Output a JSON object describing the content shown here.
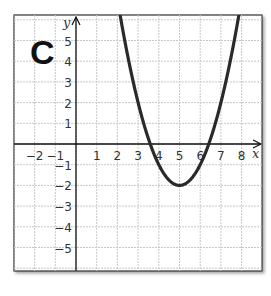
{
  "chart_data": {
    "type": "line",
    "title": "",
    "panel_label": "C",
    "xlabel": "x",
    "ylabel": "y",
    "xlim": [
      -3,
      9
    ],
    "ylim": [
      -6.2,
      6.2
    ],
    "grid": true,
    "x_ticks": [
      -2,
      -1,
      1,
      2,
      3,
      4,
      5,
      6,
      7,
      8
    ],
    "y_ticks": [
      5,
      4,
      3,
      2,
      1,
      -1,
      -2,
      -3,
      -4,
      -5
    ],
    "x_tick_labels": [
      "−2",
      "−1",
      "1",
      "2",
      "3",
      "4",
      "5",
      "6",
      "7",
      "8"
    ],
    "y_tick_labels": [
      "5",
      "4",
      "3",
      "2",
      "1",
      "−1",
      "−2",
      "−3",
      "−4",
      "−5"
    ],
    "series": [
      {
        "name": "parabola",
        "equation": "y = (x - 5)^2 - 2",
        "vertex": [
          5,
          -2
        ],
        "x_intercepts": [
          3.59,
          6.41
        ],
        "x": [
          2.17,
          2.5,
          3,
          3.5,
          4,
          4.5,
          5,
          5.5,
          6,
          6.5,
          7,
          7.5,
          7.83
        ],
        "values": [
          6.0,
          4.25,
          2.0,
          0.25,
          -1.0,
          -1.75,
          -2.0,
          -1.75,
          -1.0,
          0.25,
          2.0,
          4.25,
          6.0
        ]
      }
    ],
    "colors": {
      "curve": "#2a2a2a",
      "grid": "#c8c8c8",
      "axis": "#111111",
      "frame": "#333333"
    }
  }
}
